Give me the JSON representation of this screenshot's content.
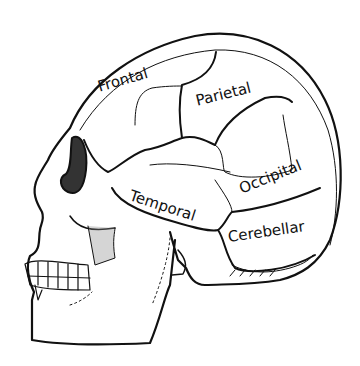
{
  "diagram": {
    "labels": {
      "frontal": "Frontal",
      "parietal": "Parietal",
      "temporal": "Temporal",
      "occipital": "Occipital",
      "cerebellar": "Cerebellar"
    },
    "colors": {
      "ink": "#111111",
      "background": "#ffffff"
    }
  }
}
